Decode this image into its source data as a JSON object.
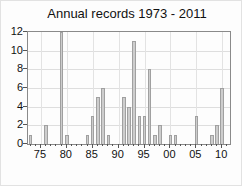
{
  "title": "Annual records 1973 - 2011",
  "colors": {
    "bar_fill": "#cdcdcd",
    "bar_border": "#a0a0a0",
    "frame": "#8a8a8a",
    "gridline": "#dedede",
    "text": "#111111",
    "background": "#fdfdfd"
  },
  "chart_data": {
    "type": "bar",
    "title": "Annual records 1973 - 2011",
    "xlabel": "",
    "ylabel": "",
    "xlim": [
      1972.5,
      2011.5
    ],
    "ylim": [
      0,
      12
    ],
    "grid": true,
    "y_ticks": [
      0,
      2,
      4,
      6,
      8,
      10,
      12
    ],
    "x_ticks": [
      {
        "year": 1975,
        "label": "75"
      },
      {
        "year": 1980,
        "label": "80"
      },
      {
        "year": 1985,
        "label": "85"
      },
      {
        "year": 1990,
        "label": "90"
      },
      {
        "year": 1995,
        "label": "95"
      },
      {
        "year": 2000,
        "label": "00"
      },
      {
        "year": 2005,
        "label": "05"
      },
      {
        "year": 2010,
        "label": "10"
      }
    ],
    "minor_x_tick_every": 1,
    "bars": [
      {
        "year": 1973,
        "value": 1
      },
      {
        "year": 1976,
        "value": 2
      },
      {
        "year": 1979,
        "value": 12
      },
      {
        "year": 1980,
        "value": 1
      },
      {
        "year": 1984,
        "value": 1
      },
      {
        "year": 1985,
        "value": 3
      },
      {
        "year": 1986,
        "value": 5
      },
      {
        "year": 1987,
        "value": 6
      },
      {
        "year": 1988,
        "value": 1
      },
      {
        "year": 1991,
        "value": 5
      },
      {
        "year": 1992,
        "value": 4
      },
      {
        "year": 1993,
        "value": 11
      },
      {
        "year": 1994,
        "value": 3
      },
      {
        "year": 1995,
        "value": 3
      },
      {
        "year": 1996,
        "value": 8
      },
      {
        "year": 1997,
        "value": 1
      },
      {
        "year": 1998,
        "value": 2
      },
      {
        "year": 2000,
        "value": 1
      },
      {
        "year": 2001,
        "value": 1
      },
      {
        "year": 2005,
        "value": 3
      },
      {
        "year": 2008,
        "value": 1
      },
      {
        "year": 2009,
        "value": 2
      },
      {
        "year": 2010,
        "value": 6
      }
    ]
  }
}
